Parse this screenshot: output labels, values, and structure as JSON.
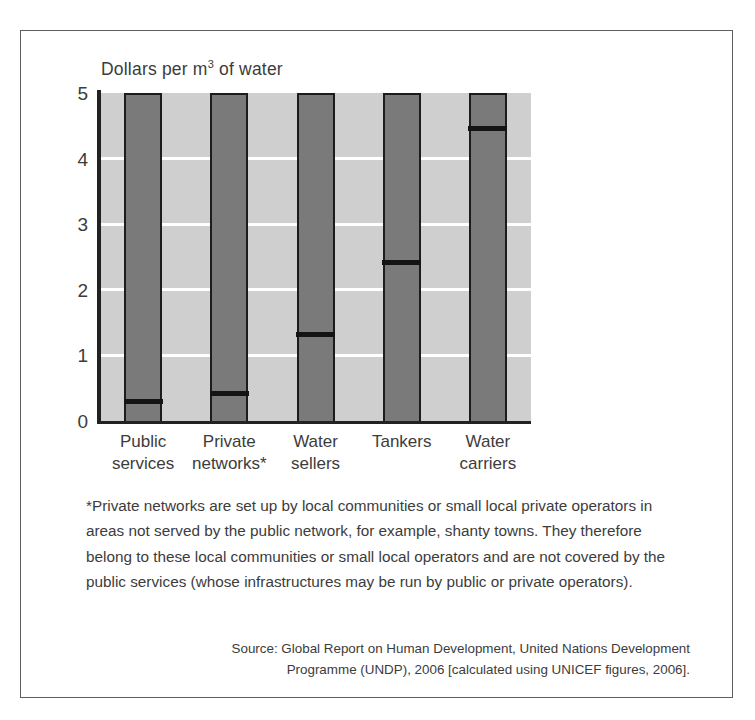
{
  "chart_data": {
    "type": "bar",
    "title_main": "Dollars per m",
    "title_sup": "3",
    "title_tail": " of water",
    "xlabel": "",
    "ylabel": "Dollars per m³ of water",
    "ylim": [
      0,
      5
    ],
    "yticks": [
      "5",
      "4",
      "3",
      "2",
      "1",
      "0"
    ],
    "ytick_values": [
      5,
      4,
      3,
      2,
      1,
      0
    ],
    "grid": true,
    "grid_axis": "y",
    "legend": "none",
    "categories": [
      "Public services",
      "Private networks*",
      "Water sellers",
      "Tankers",
      "Water carriers"
    ],
    "category_lines": [
      [
        "Public",
        "services"
      ],
      [
        "Private",
        "networks*"
      ],
      [
        "Water",
        "sellers"
      ],
      [
        "Tankers",
        ""
      ],
      [
        "Water",
        "carriers"
      ]
    ],
    "values": [
      0.33,
      0.45,
      1.35,
      2.45,
      4.49
    ],
    "bar_color": "#7a7a7a",
    "marker_color": "#141414",
    "plot_background": "#cfcfcf",
    "gridline_color": "#ffffff",
    "note": "Bars are drawn full height with a black horizontal marker line indicating the value."
  },
  "footnote": {
    "text": "*Private networks are set up by local communities or small local private operators in areas not served by the public network, for example, shanty towns. They therefore belong to these local communities or small local operators and are not covered by the public services (whose infrastructures may be run by public or private operators)."
  },
  "source": {
    "line1": "Source: Global Report on Human Development, United Nations Development",
    "line2": "Programme (UNDP), 2006 [calculated using UNICEF figures, 2006]."
  }
}
